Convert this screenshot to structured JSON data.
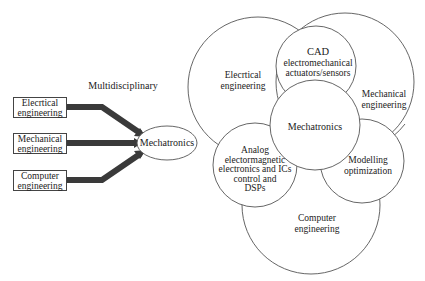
{
  "left_diagram": {
    "title": "Multidisciplinary",
    "inputs": [
      {
        "line1": "Elecrtical",
        "line2": "engineering"
      },
      {
        "line1": "Mechanical",
        "line2": "engineering"
      },
      {
        "line1": "Computer",
        "line2": "engineering"
      }
    ],
    "target": "Mechatronics",
    "arrow_color": "#3a3a3a"
  },
  "venn_diagram": {
    "circles": [
      {
        "id": "electrical",
        "lines": [
          "Elecrtical",
          "engineering"
        ]
      },
      {
        "id": "mechanical",
        "lines": [
          "Mechanical",
          "engineering"
        ]
      },
      {
        "id": "computer",
        "lines": [
          "Computer",
          "engineering"
        ]
      },
      {
        "id": "cad",
        "lines": [
          "CAD",
          "electromechanical",
          "actuators/sensors"
        ]
      },
      {
        "id": "analog",
        "lines": [
          "Analog",
          "electormagnetic",
          "electronics and ICs",
          "control and",
          "DSPs"
        ]
      },
      {
        "id": "modelling",
        "lines": [
          "Modelling",
          "optimization"
        ]
      },
      {
        "id": "mechatronics",
        "lines": [
          "Mechatronics"
        ]
      }
    ],
    "stroke_color": "#555555"
  }
}
